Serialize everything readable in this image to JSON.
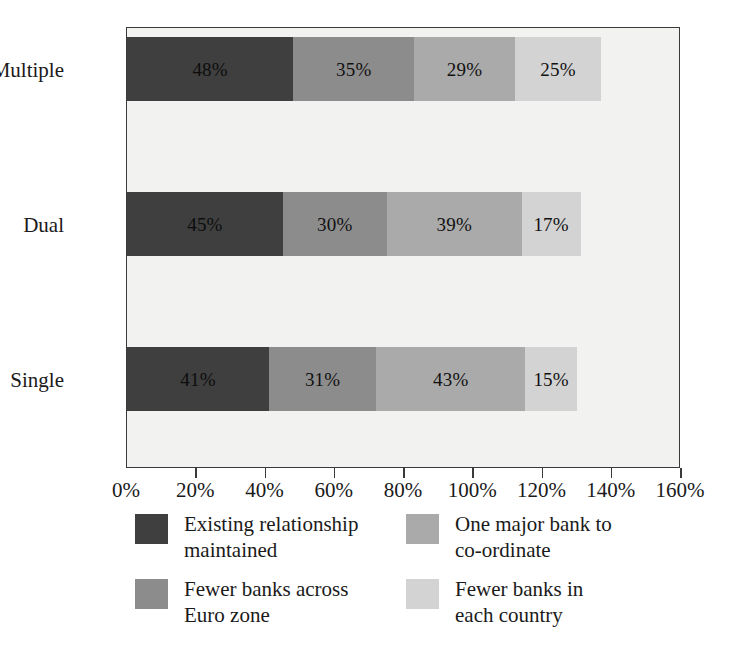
{
  "chart_data": {
    "type": "bar",
    "orientation": "horizontal",
    "stacked": true,
    "title": "",
    "subtitle": "",
    "xlabel": "",
    "ylabel": "",
    "categories": [
      "Multiple",
      "Dual",
      "Single"
    ],
    "series": [
      {
        "name": "Existing relationship maintained",
        "color": "#3f3f3f",
        "values": [
          48,
          45,
          41
        ],
        "labels": [
          "48%",
          "45%",
          "41%"
        ]
      },
      {
        "name": "Fewer banks across Euro zone",
        "color": "#8c8c8c",
        "values": [
          35,
          30,
          31
        ],
        "labels": [
          "35%",
          "30%",
          "31%"
        ]
      },
      {
        "name": "One major bank to co-ordinate",
        "color": "#aaaaaa",
        "values": [
          29,
          39,
          43
        ],
        "labels": [
          "29%",
          "39%",
          "43%"
        ]
      },
      {
        "name": "Fewer banks in each country",
        "color": "#d3d3d3",
        "values": [
          25,
          17,
          15
        ],
        "labels": [
          "25%",
          "17%",
          "15%"
        ]
      }
    ],
    "totals": [
      137,
      131,
      130
    ],
    "xlim": [
      0,
      160
    ],
    "xticks": [
      0,
      20,
      40,
      60,
      80,
      100,
      120,
      140,
      160
    ],
    "xtick_labels": [
      "0%",
      "20%",
      "40%",
      "60%",
      "80%",
      "100%",
      "120%",
      "140%",
      "160%"
    ],
    "grid": false,
    "legend_position": "bottom",
    "legend_columns": 2,
    "legend_order": [
      "Existing relationship maintained",
      "One major bank to co-ordinate",
      "Fewer banks across Euro zone",
      "Fewer banks in each country"
    ],
    "plot_background": "#f2f2f0",
    "axis_color": "#3a3a3a",
    "text_color": "#1a1a1a"
  },
  "legend": [
    {
      "label_line1": "Existing relationship",
      "label_line2": "maintained",
      "color": "#3f3f3f"
    },
    {
      "label_line1": "One major bank to",
      "label_line2": "co-ordinate",
      "color": "#aaaaaa"
    },
    {
      "label_line1": "Fewer banks across",
      "label_line2": "Euro zone",
      "color": "#8c8c8c"
    },
    {
      "label_line1": "Fewer banks in",
      "label_line2": "each country",
      "color": "#d3d3d3"
    }
  ]
}
